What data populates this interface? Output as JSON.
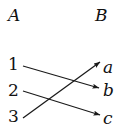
{
  "figure": {
    "type": "mapping-diagram",
    "stroke_color": "#1a1a1a",
    "text_color": "#111111",
    "background_color": "#ffffff",
    "width": 119,
    "height": 138
  },
  "sets": {
    "left": {
      "label": "A"
    },
    "right": {
      "label": "B"
    }
  },
  "domain_elements": [
    {
      "id": "1",
      "label": "1",
      "x": 8,
      "y": 56
    },
    {
      "id": "2",
      "label": "2",
      "x": 8,
      "y": 82
    },
    {
      "id": "3",
      "label": "3",
      "x": 8,
      "y": 108
    }
  ],
  "codomain_elements": [
    {
      "id": "a",
      "label": "a",
      "x": 103,
      "y": 59
    },
    {
      "id": "b",
      "label": "b",
      "x": 103,
      "y": 82
    },
    {
      "id": "c",
      "label": "c",
      "x": 103,
      "y": 110
    }
  ],
  "arrows": [
    {
      "name": "arrow-1-to-b",
      "from": "1",
      "to": "b",
      "x1": 23,
      "y1": 66,
      "x2": 99,
      "y2": 88
    },
    {
      "name": "arrow-2-to-c",
      "from": "2",
      "to": "c",
      "x1": 23,
      "y1": 91,
      "x2": 100,
      "y2": 115
    },
    {
      "name": "arrow-3-to-a",
      "from": "3",
      "to": "a",
      "x1": 23,
      "y1": 118,
      "x2": 100,
      "y2": 62
    }
  ]
}
